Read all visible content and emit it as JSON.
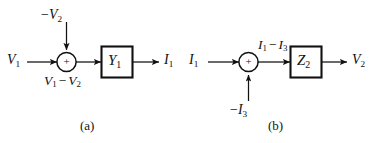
{
  "figure": {
    "background_color": "#ffffff",
    "line_color": "#111111",
    "text_color": "#101010",
    "width": 371,
    "height": 143,
    "diagrams": [
      {
        "id": "a",
        "caption": "(a)",
        "input_label": "V",
        "input_sub": "1",
        "summing_input_sign": "−",
        "summing_input_label": "V",
        "summing_input_sub": "2",
        "summing_input_direction": "from-top",
        "junction_sign": "+",
        "junction_output_label_left": "V",
        "junction_output_label_left_sub": "1",
        "junction_output_operator": "−",
        "junction_output_label_right": "V",
        "junction_output_label_right_sub": "2",
        "junction_output_position": "below",
        "block_label": "Y",
        "block_label_sub": "1",
        "output_label": "I",
        "output_sub": "1"
      },
      {
        "id": "b",
        "caption": "(b)",
        "input_label": "I",
        "input_sub": "1",
        "summing_input_sign": "−",
        "summing_input_label": "I",
        "summing_input_sub": "3",
        "summing_input_direction": "from-bottom",
        "junction_sign": "+",
        "junction_output_label_left": "I",
        "junction_output_label_left_sub": "1",
        "junction_output_operator": "−",
        "junction_output_label_right": "I",
        "junction_output_label_right_sub": "3",
        "junction_output_position": "above",
        "block_label": "Z",
        "block_label_sub": "2",
        "output_label": "V",
        "output_sub": "2"
      }
    ]
  }
}
